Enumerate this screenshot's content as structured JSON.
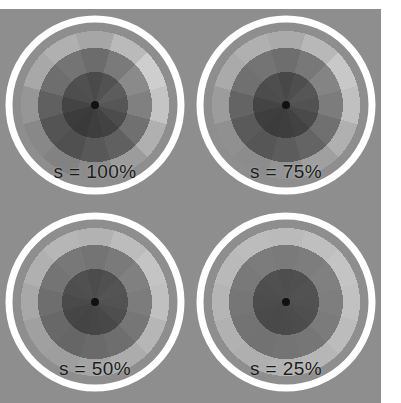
{
  "figure": {
    "background_color": "#8e8e8e",
    "margin_color": "#ffffff",
    "ring_outline_color": "#ffffff",
    "center_dot_color": "#111111",
    "label_color": "#1b1b1b"
  },
  "chart_data": {
    "type": "pie",
    "title": "",
    "subtitle": "",
    "xlabel": "",
    "ylabel": "",
    "layout": {
      "rows": 2,
      "cols": 2,
      "legend": "none",
      "grid": false
    },
    "sector_count": 12,
    "ring_count": 3,
    "sector_angle_deg": 30,
    "ring_radii_px": [
      33,
      57,
      74
    ],
    "outline_radius_px": 86,
    "center_dot_radius_px": 4,
    "sector_start_angle_deg": -105,
    "panels": [
      {
        "label": "s = 100%",
        "saturation_percent": 100,
        "position": "top-left",
        "rings": [
          {
            "ring": "inner",
            "values": [
              74,
              82,
              92,
              86,
              76,
              66,
              62,
              58,
              60,
              68,
              78,
              80
            ]
          },
          {
            "ring": "middle",
            "values": [
              108,
              122,
              138,
              128,
              112,
              96,
              88,
              80,
              84,
              96,
              110,
              116
            ]
          },
          {
            "ring": "outer",
            "values": [
              166,
              186,
              206,
              196,
              176,
              156,
              140,
              130,
              136,
              150,
              168,
              176
            ]
          }
        ]
      },
      {
        "label": "s = 75%",
        "saturation_percent": 75,
        "position": "top-right",
        "rings": [
          {
            "ring": "inner",
            "values": [
              72,
              78,
              86,
              82,
              74,
              66,
              62,
              60,
              62,
              68,
              76,
              78
            ]
          },
          {
            "ring": "middle",
            "values": [
              110,
              120,
              132,
              124,
              112,
              100,
              92,
              86,
              90,
              100,
              112,
              116
            ]
          },
          {
            "ring": "outer",
            "values": [
              170,
              184,
              200,
              192,
              176,
              160,
              148,
              140,
              144,
              156,
              170,
              176
            ]
          }
        ]
      },
      {
        "label": "s = 50%",
        "saturation_percent": 50,
        "position": "bottom-left",
        "rings": [
          {
            "ring": "inner",
            "values": [
              76,
              80,
              84,
              82,
              78,
              72,
              70,
              68,
              70,
              74,
              78,
              80
            ]
          },
          {
            "ring": "middle",
            "values": [
              116,
              122,
              128,
              124,
              118,
              110,
              106,
              102,
              104,
              110,
              116,
              120
            ]
          },
          {
            "ring": "outer",
            "values": [
              178,
              188,
              196,
              192,
              182,
              172,
              164,
              158,
              160,
              168,
              176,
              182
            ]
          }
        ]
      },
      {
        "label": "s = 25%",
        "saturation_percent": 25,
        "position": "bottom-right",
        "rings": [
          {
            "ring": "inner",
            "values": [
              78,
              80,
              82,
              81,
              79,
              76,
              74,
              73,
              74,
              76,
              78,
              80
            ]
          },
          {
            "ring": "middle",
            "values": [
              122,
              125,
              128,
              126,
              123,
              118,
              116,
              114,
              115,
              118,
              121,
              124
            ]
          },
          {
            "ring": "outer",
            "values": [
              186,
              191,
              196,
              193,
              188,
              182,
              178,
              175,
              177,
              181,
              185,
              188
            ]
          }
        ]
      }
    ]
  }
}
